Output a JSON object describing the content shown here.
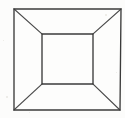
{
  "figure": {
    "title": "Perspective box line drawing",
    "shape_type": "one-point-perspective-box",
    "canvas": {
      "width": 125,
      "height": 118,
      "background_color": "#fcfcfb"
    },
    "style": {
      "stroke_color": "#3b3b3b",
      "stroke_width": 1.35,
      "fill_color": "#fdfdfc",
      "line_cap": "square"
    },
    "outer_square": {
      "name": "outer-square",
      "top_left": [
        14,
        9
      ],
      "top_right": [
        121,
        9
      ],
      "bottom_right": [
        120,
        110
      ],
      "bottom_left": [
        14,
        110
      ],
      "width": 107,
      "height": 101
    },
    "inner_square": {
      "name": "inner-square",
      "top_left": [
        42,
        34
      ],
      "top_right": [
        93,
        34
      ],
      "bottom_right": [
        93,
        84
      ],
      "bottom_left": [
        42,
        84
      ],
      "width": 51,
      "height": 50
    },
    "diagonals": [
      {
        "name": "diagonal-top-left",
        "from": [
          14,
          9
        ],
        "to": [
          42,
          34
        ]
      },
      {
        "name": "diagonal-top-right",
        "from": [
          121,
          9
        ],
        "to": [
          93,
          34
        ]
      },
      {
        "name": "diagonal-bottom-right",
        "from": [
          120,
          110
        ],
        "to": [
          93,
          84
        ]
      },
      {
        "name": "diagonal-bottom-left",
        "from": [
          14,
          110
        ],
        "to": [
          42,
          84
        ]
      }
    ],
    "paths": {
      "outer_square_d": "M 14 9 L 121 9 L 120 110 L 14 110 Z",
      "inner_square_d": "M 42 34 L 93 34 L 93 84 L 42 84 Z",
      "diagonal_tl_d": "M 14 9 L 42 34",
      "diagonal_tr_d": "M 121 9 L 93 34",
      "diagonal_br_d": "M 120 110 L 93 84",
      "diagonal_bl_d": "M 14 110 L 42 84"
    },
    "specks": [
      {
        "left": 6,
        "top": 96,
        "size": 2
      },
      {
        "left": 105,
        "top": 14,
        "size": 2
      },
      {
        "left": 29,
        "top": 112,
        "size": 1
      },
      {
        "left": 116,
        "top": 72,
        "size": 1
      },
      {
        "left": 3,
        "top": 40,
        "size": 1
      }
    ]
  }
}
